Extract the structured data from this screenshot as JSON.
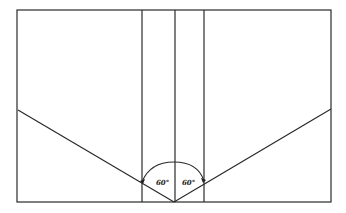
{
  "diagram": {
    "type": "geometric-angle-diagram",
    "frame": {
      "x": 17,
      "y": 10,
      "width": 314,
      "height": 192
    },
    "vertical_lines_x": [
      142,
      175,
      204
    ],
    "apex": {
      "x": 174,
      "y": 202
    },
    "left_ray_end": {
      "x": 18,
      "y": 110
    },
    "right_ray_end": {
      "x": 331,
      "y": 109
    },
    "angles": [
      {
        "label": "60°",
        "side": "left"
      },
      {
        "label": "60°",
        "side": "right"
      }
    ]
  }
}
